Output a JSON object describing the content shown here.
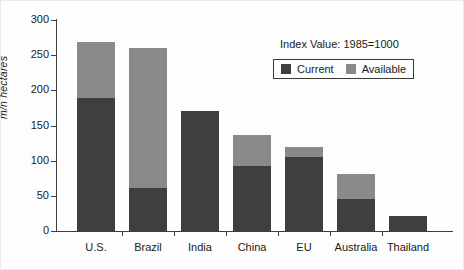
{
  "chart_data": {
    "type": "bar",
    "stacked": true,
    "title": "",
    "subtitle": "",
    "xlabel": "",
    "ylabel": "m/n hectares",
    "annotation": "Index Value: 1985=1000",
    "categories": [
      "U.S.",
      "Brazil",
      "India",
      "China",
      "EU",
      "Australia",
      "Thailand"
    ],
    "series": [
      {
        "name": "Current",
        "color": "#3f3f3f",
        "values": [
          189,
          61,
          171,
          93,
          105,
          45,
          22
        ]
      },
      {
        "name": "Available",
        "color": "#8a8a8a",
        "values": [
          80,
          199,
          0,
          43,
          14,
          36,
          0
        ]
      }
    ],
    "totals": [
      269,
      260,
      171,
      136,
      119,
      81,
      22
    ],
    "ylim": [
      0,
      300
    ],
    "yticks": [
      0,
      50,
      100,
      150,
      200,
      250,
      300
    ],
    "ytick_labels": [
      "0",
      "50",
      "100",
      "150",
      "200",
      "250",
      "300"
    ],
    "grid": false,
    "legend_position": "top-right"
  },
  "legend": {
    "title": "Index Value: 1985=1000",
    "entries": [
      {
        "label": "Current",
        "color": "#3f3f3f"
      },
      {
        "label": "Available",
        "color": "#8a8a8a"
      }
    ]
  },
  "axes": {
    "y_title": "m/n hectares"
  }
}
